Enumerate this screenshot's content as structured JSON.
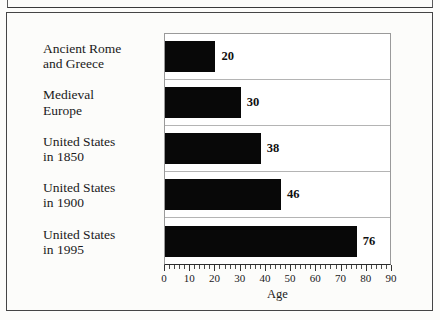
{
  "figure": {
    "background_color": "#fcfcfa",
    "frame_color": "#454545",
    "bar_color": "#080808",
    "gridline_color": "#b4b4b4",
    "axis_color": "#2b2b2b"
  },
  "chart_data": {
    "type": "bar",
    "orientation": "horizontal",
    "title": "",
    "xlabel": "Age",
    "ylabel": "",
    "xlim": [
      0,
      90
    ],
    "xticks": [
      0,
      10,
      20,
      30,
      40,
      50,
      60,
      70,
      80,
      90
    ],
    "xticklabels": [
      "0",
      "10",
      "20",
      "30",
      "40",
      "50",
      "60",
      "70",
      "80",
      "90"
    ],
    "minor_tick_interval": 2,
    "grid": "horizontal-row-separators",
    "legend": "none",
    "categories": [
      "Ancient Rome\nand Greece",
      "Medieval\nEurope",
      "United States\nin 1850",
      "United States\nin 1900",
      "United States\nin 1995"
    ],
    "values": [
      20,
      30,
      38,
      46,
      76
    ],
    "data_labels": [
      "20",
      "30",
      "38",
      "46",
      "76"
    ]
  }
}
